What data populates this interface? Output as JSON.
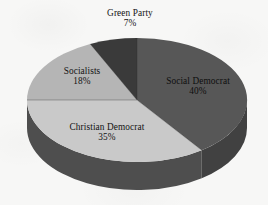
{
  "chart_data": {
    "type": "pie",
    "title": "",
    "subtitle": "",
    "xlabel": "",
    "ylabel": "",
    "legend_position": "none",
    "grid": false,
    "style": "3d-pie",
    "total_percent": 100,
    "start_angle_deg": 0,
    "direction": "clockwise",
    "categories": [
      "Social Democrat",
      "Christian Democrat",
      "Socialists",
      "Green Party"
    ],
    "values": [
      40,
      35,
      18,
      7
    ],
    "value_suffix": "%",
    "slices": [
      {
        "label": "Social Democrat",
        "value": 40,
        "value_text": "40%",
        "top_color": "#575757",
        "side_color": "#414141",
        "label_placement": "inside",
        "label_color": "#0e0e0e"
      },
      {
        "label": "Christian Democrat",
        "value": 35,
        "value_text": "35%",
        "top_color": "#c9c9c9",
        "side_color": "#4e4e4e",
        "label_placement": "inside",
        "label_color": "#131313"
      },
      {
        "label": "Socialists",
        "value": 18,
        "value_text": "18%",
        "top_color": "#b5b5b5",
        "side_color": "#4a4a4a",
        "label_placement": "inside",
        "label_color": "#131313"
      },
      {
        "label": "Green Party",
        "value": 7,
        "value_text": "7%",
        "top_color": "#3a3a3a",
        "side_color": "#333333",
        "label_placement": "outside-top",
        "label_color": "#131313"
      }
    ]
  },
  "figure": {
    "background_color": "#f7f7f6",
    "center_x": 137,
    "center_y": 100,
    "radius_x": 110,
    "radius_y": 62,
    "depth": 28
  },
  "labels": {
    "green": {
      "name": "Green Party",
      "value": "7%"
    },
    "social_democrat": {
      "name": "Social Democrat",
      "value": "40%"
    },
    "socialists": {
      "name": "Socialists",
      "value": "18%"
    },
    "christian_democrat": {
      "name": "Christian Democrat",
      "value": "35%"
    }
  }
}
